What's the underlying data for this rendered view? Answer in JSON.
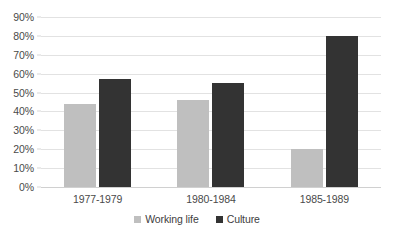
{
  "chart_data": {
    "type": "bar",
    "title": "",
    "subtitle": "",
    "xlabel": "",
    "ylabel": "",
    "categories": [
      "1977-1979",
      "1980-1984",
      "1985-1989"
    ],
    "series": [
      {
        "name": "Working life",
        "color": "#bfbfbf",
        "values": [
          44,
          46,
          20
        ]
      },
      {
        "name": "Culture",
        "color": "#333333",
        "values": [
          57,
          55,
          80
        ]
      }
    ],
    "ylim": [
      0,
      90
    ],
    "ytick_step": 10,
    "ytick_labels": [
      "0%",
      "10%",
      "20%",
      "30%",
      "40%",
      "50%",
      "60%",
      "70%",
      "80%",
      "90%"
    ],
    "ytick_values": [
      0,
      10,
      20,
      30,
      40,
      50,
      60,
      70,
      80,
      90
    ],
    "grid": true,
    "grid_axis": "y",
    "grid_color": "#e2e2e2",
    "legend": true,
    "legend_position": "bottom",
    "legend_entries": [
      "Working life",
      "Culture"
    ],
    "background": "#ffffff",
    "value_format": "percent"
  }
}
